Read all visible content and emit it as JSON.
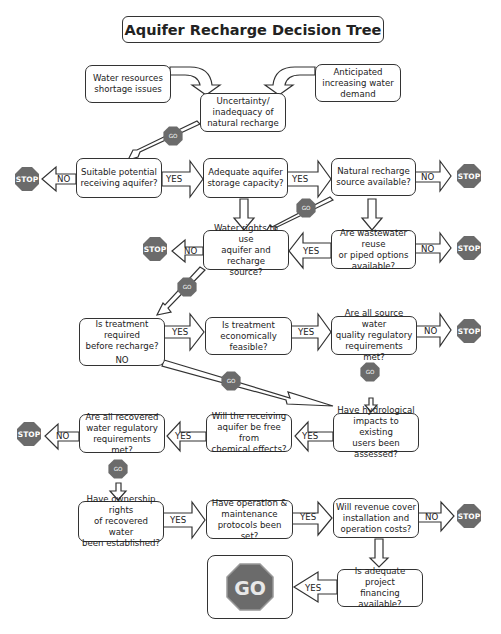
{
  "title": "Aquifer Recharge Decision Tree",
  "colors": {
    "sign": "#6b6b6b",
    "sign_text": "#ffffff",
    "border": "#333333"
  },
  "inputs": {
    "left": "Water resources shortage issues",
    "right": "Anticipated increasing water demand",
    "center": [
      "Uncertainty/",
      "inadequacy of",
      "natural recharge"
    ]
  },
  "nodes": {
    "suitable_aquifer": [
      "Suitable potential",
      "receiving aquifer?"
    ],
    "storage_capacity": [
      "Adequate aquifer",
      "storage capacity?"
    ],
    "natural_source": [
      "Natural recharge",
      "source available?"
    ],
    "water_rights": [
      "Water rights to use",
      "aquifer and recharge",
      "source?"
    ],
    "wastewater_reuse": [
      "Are wastewater reuse",
      "or piped options",
      "available?"
    ],
    "treatment_required": [
      "Is treatment required",
      "before recharge?"
    ],
    "treatment_required_no": "NO",
    "treatment_feasible": [
      "Is treatment",
      "economically",
      "feasible?"
    ],
    "source_quality": [
      "Are all source water",
      "quality regulatory",
      "requirements met?"
    ],
    "hydrological_impacts": [
      "Have hydrological",
      "impacts to existing",
      "users been assessed?"
    ],
    "chemical_effects": [
      "Will the receiving",
      "aquifer be free from",
      "chemical effects?"
    ],
    "recovered_quality": [
      "Are all recovered",
      "water regulatory",
      "requirements met?"
    ],
    "ownership_rights": [
      "Have ownership rights",
      "of recovered water",
      "been established?"
    ],
    "om_protocols": [
      "Have operation &",
      "maintenance",
      "protocols been set?"
    ],
    "revenue": [
      "Will revenue cover",
      "installation and",
      "operation costs?"
    ],
    "financing": [
      "Is adequate project",
      "financing available?"
    ]
  },
  "labels": {
    "yes": "YES",
    "no": "NO",
    "stop": "STOP",
    "go": "GO"
  }
}
